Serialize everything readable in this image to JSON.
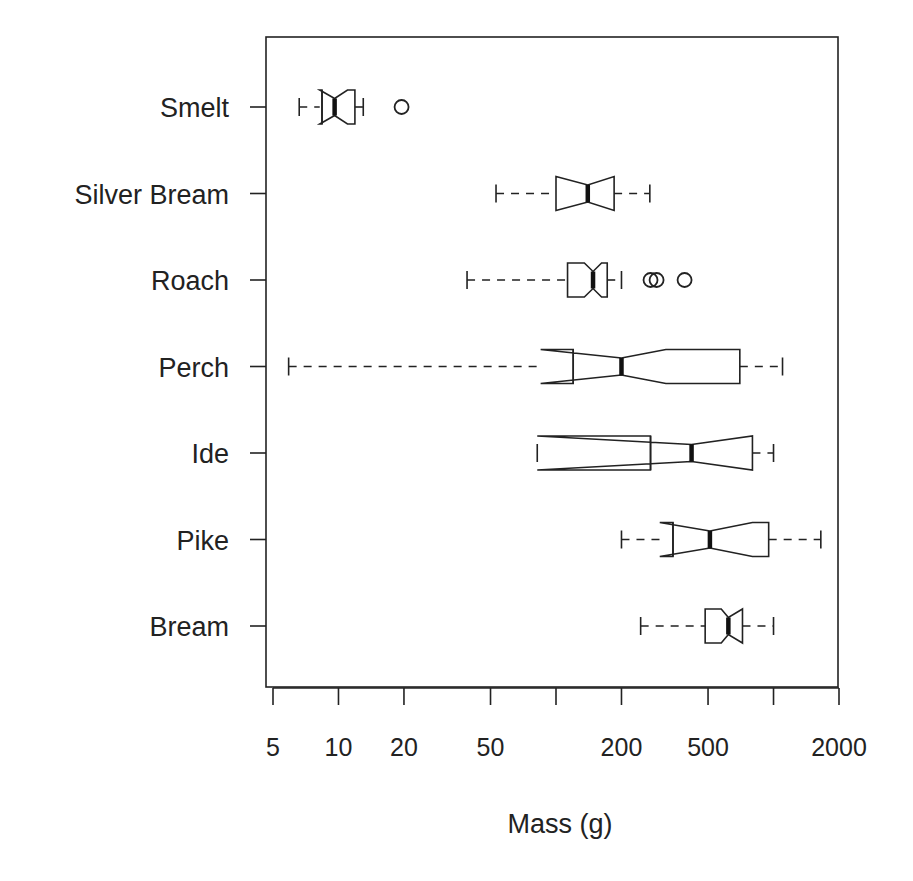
{
  "chart_data": {
    "type": "boxplot",
    "orientation": "horizontal",
    "notched": true,
    "title": "",
    "xlabel": "Mass (g)",
    "ylabel": "",
    "xscale": "log",
    "xlim": [
      5,
      2000
    ],
    "x_ticks": [
      5,
      10,
      20,
      50,
      100,
      200,
      500,
      1000,
      2000
    ],
    "x_tick_labels": [
      "5",
      "10",
      "20",
      "50",
      "",
      "200",
      "500",
      "",
      "2000"
    ],
    "categories": [
      "Smelt",
      "Silver Bream",
      "Roach",
      "Perch",
      "Ide",
      "Pike",
      "Bream"
    ],
    "series": [
      {
        "name": "Smelt",
        "whisker_low": 6.6,
        "q1": 8.4,
        "median": 9.6,
        "q3": 11.9,
        "whisker_high": 13,
        "notch_low": 8.2,
        "notch_high": 11.0,
        "outliers": [
          19.5
        ]
      },
      {
        "name": "Silver Bream",
        "whisker_low": 53,
        "q1": 100,
        "median": 140,
        "q3": 185,
        "whisker_high": 270,
        "notch_low": 100,
        "notch_high": 185,
        "outliers": []
      },
      {
        "name": "Roach",
        "whisker_low": 39,
        "q1": 113,
        "median": 148,
        "q3": 172,
        "whisker_high": 200,
        "notch_low": 135,
        "notch_high": 162,
        "outliers": [
          272,
          290,
          390
        ]
      },
      {
        "name": "Perch",
        "whisker_low": 5.9,
        "q1": 120,
        "median": 200,
        "q3": 700,
        "whisker_high": 1100,
        "notch_low": 85,
        "notch_high": 320,
        "outliers": []
      },
      {
        "name": "Ide",
        "whisker_low": 82,
        "q1": 272,
        "median": 420,
        "q3": 800,
        "whisker_high": 1000,
        "notch_low": 82,
        "notch_high": 800,
        "outliers": []
      },
      {
        "name": "Pike",
        "whisker_low": 200,
        "q1": 345,
        "median": 510,
        "q3": 950,
        "whisker_high": 1650,
        "notch_low": 300,
        "notch_high": 800,
        "outliers": []
      },
      {
        "name": "Bream",
        "whisker_low": 245,
        "q1": 485,
        "median": 620,
        "q3": 720,
        "whisker_high": 1000,
        "notch_low": 575,
        "notch_high": 720,
        "outliers": []
      }
    ],
    "grid": false,
    "legend": null
  },
  "labels": {
    "xlabel": "Mass (g)"
  }
}
